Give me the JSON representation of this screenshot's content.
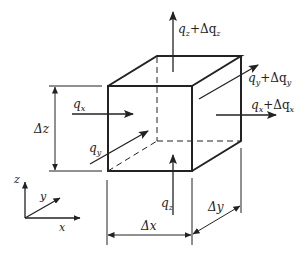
{
  "diagram": {
    "labels": {
      "qz_out": "qₓ",
      "qz_plus": "q_z+Δq_z",
      "qy_plus": "q_y+Δq_y",
      "qx_plus": "q_x+Δq_x",
      "qx": "q_x",
      "qy": "q_y",
      "qz": "q_z",
      "dz": "Δz",
      "dx": "Δx",
      "dy": "Δy",
      "axis_x": "x",
      "axis_y": "y",
      "axis_z": "z"
    },
    "text": {
      "qz_plus_main": "q",
      "qz_plus_sub": "z",
      "qz_plus_rest": "+Δq",
      "qz_plus_sub2": "z",
      "qy_plus_main": "q",
      "qy_plus_sub": "y",
      "qy_plus_rest": "+Δq",
      "qy_plus_sub2": "y",
      "qx_plus_main": "q",
      "qx_plus_sub": "x",
      "qx_plus_rest": "+Δq",
      "qx_plus_sub2": "x",
      "qx_main": "q",
      "qx_sub": "x",
      "qy_main": "q",
      "qy_sub": "y",
      "qz_main": "q",
      "qz_sub": "z",
      "dz": "Δz",
      "dx": "Δx",
      "dy": "Δy",
      "axis_x": "x",
      "axis_y": "y",
      "axis_z": "z"
    }
  }
}
